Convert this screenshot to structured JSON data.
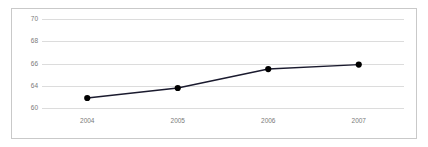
{
  "chart_data": {
    "type": "line",
    "title": "",
    "subtitle": "",
    "xlabel": "",
    "ylabel": "",
    "categories": [
      "2004",
      "2005",
      "2006",
      "2007"
    ],
    "x": [
      2004,
      2005,
      2006,
      2007
    ],
    "series": [
      {
        "name": "",
        "values": [
          62.9,
          63.8,
          65.5,
          65.9
        ],
        "color": "#1a1a2e",
        "marker": "filled-circle",
        "marker_color": "#000000"
      }
    ],
    "ytick_labels": [
      "70",
      "68",
      "66",
      "64",
      "60"
    ],
    "ytick_values": [
      70,
      68,
      66,
      64,
      60
    ],
    "ylim": [
      60,
      70
    ],
    "xlim": [
      2004,
      2007
    ],
    "grid": {
      "horizontal": true,
      "vertical": false,
      "color": "#dcdcdc"
    },
    "legend": {
      "visible": false,
      "entries": []
    },
    "frame": {
      "visible": true,
      "color": "#c9c9c9"
    },
    "background_color": "#ffffff",
    "axis_label_color": "#7a7a7a"
  }
}
